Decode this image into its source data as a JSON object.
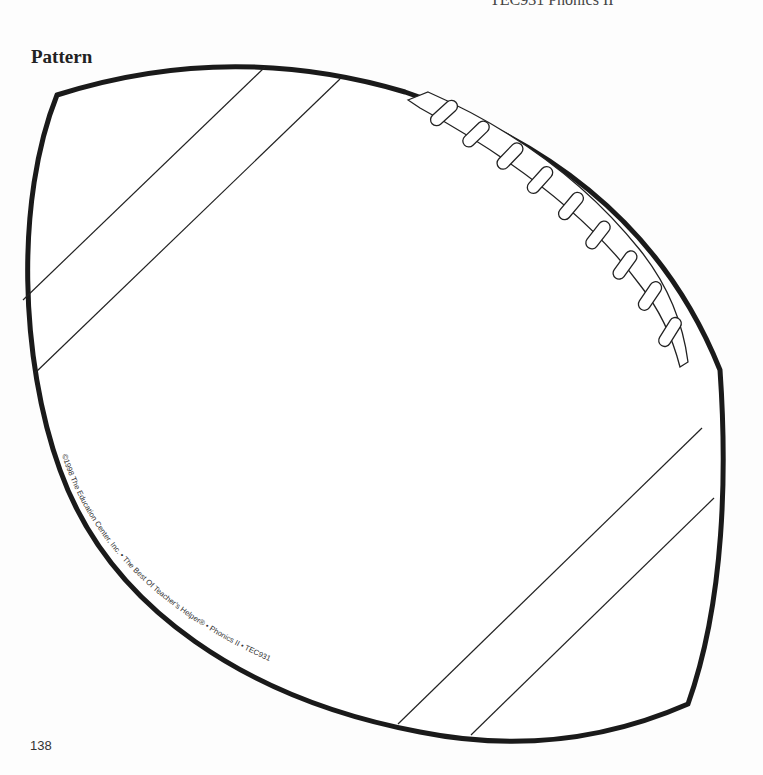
{
  "page": {
    "top_cut_text": "TEC931 Phonics II",
    "heading": "Pattern",
    "page_number": "138"
  },
  "pattern": {
    "shape": "football",
    "lace_count": 9,
    "stripe_count": 4,
    "outline_color": "#1a1a1a",
    "fill_color": "#ffffff"
  },
  "copyright": {
    "text": "©1998 The Education Center, Inc. • The Best Of Teacher's Helper® • Phonics II • TEC931"
  }
}
